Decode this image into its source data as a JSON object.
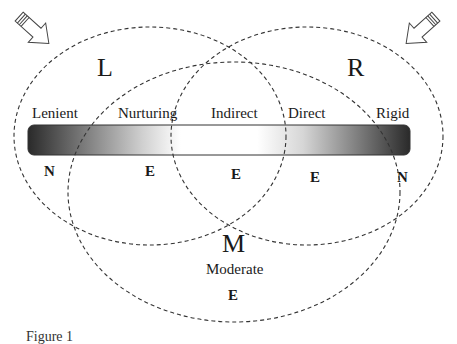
{
  "diagram": {
    "circles": [
      {
        "id": "L",
        "label": "L",
        "cx": 150,
        "cy": 136,
        "rx": 136,
        "ry": 109
      },
      {
        "id": "R",
        "label": "R",
        "cx": 307,
        "cy": 136,
        "rx": 136,
        "ry": 109
      },
      {
        "id": "M",
        "label": "M",
        "cx": 234,
        "cy": 192,
        "rx": 166,
        "ry": 130
      }
    ],
    "spectrum_bar": {
      "x": 28,
      "y": 125,
      "width": 382,
      "height": 30,
      "gradient_stops": [
        {
          "offset": "0%",
          "color": "#2a2a2a"
        },
        {
          "offset": "30%",
          "color": "#d0d0d0"
        },
        {
          "offset": "40%",
          "color": "#ffffff"
        },
        {
          "offset": "60%",
          "color": "#ffffff"
        },
        {
          "offset": "72%",
          "color": "#d6d6d6"
        },
        {
          "offset": "100%",
          "color": "#2a2a2a"
        }
      ]
    },
    "styles": [
      "Lenient",
      "Nurturing",
      "Indirect",
      "Direct",
      "Rigid"
    ],
    "style_labels": {
      "lenient": "Lenient",
      "nurturing": "Nurturing",
      "indirect": "Indirect",
      "direct": "Direct",
      "rigid": "Rigid"
    },
    "region_codes": {
      "lenient": "N",
      "nurturing": "E",
      "indirect": "E",
      "direct": "E",
      "rigid": "N",
      "moderate": "E"
    },
    "circle_labels": {
      "left": "L",
      "right": "R",
      "middle": "M",
      "middle_sub": "Moderate"
    },
    "arrows": [
      {
        "id": "arrow-left",
        "direction": "down-right"
      },
      {
        "id": "arrow-right",
        "direction": "down-left"
      }
    ]
  },
  "caption": "Figure 1"
}
